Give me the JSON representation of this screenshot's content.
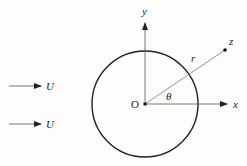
{
  "diagram": {
    "labels": {
      "y_axis": "y",
      "x_axis": "x",
      "origin": "O",
      "point": "z",
      "radius": "r",
      "angle": "θ",
      "flow_top": "U",
      "flow_bottom": "U"
    },
    "geometry": {
      "circle_center": [
        145,
        104
      ],
      "circle_radius": 53,
      "point_z": [
        225,
        50
      ]
    },
    "colors": {
      "stroke": "#222222",
      "thin_stroke": "#555555"
    }
  }
}
